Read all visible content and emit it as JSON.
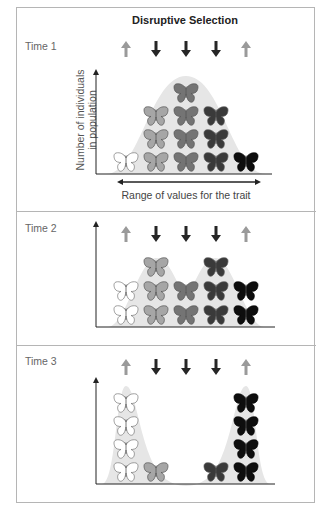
{
  "figure": {
    "title": "Disruptive Selection",
    "y_axis_label_line1": "Number of individuals",
    "y_axis_label_line2": "in population",
    "x_axis_label": "Range of values for the trait"
  },
  "selection_arrows": [
    {
      "column": 1,
      "direction": "up",
      "color": "#9a9a9a"
    },
    {
      "column": 2,
      "direction": "down",
      "color": "#262626"
    },
    {
      "column": 3,
      "direction": "down",
      "color": "#262626"
    },
    {
      "column": 4,
      "direction": "down",
      "color": "#262626"
    },
    {
      "column": 5,
      "direction": "up",
      "color": "#9a9a9a"
    }
  ],
  "phenotype_colors": [
    "#ffffff",
    "#a6a6a6",
    "#747474",
    "#3a3a3a",
    "#0e0e0e"
  ],
  "curve_fill": "#e6e6e6",
  "panels": [
    {
      "label": "Time 1",
      "counts": [
        1,
        3,
        4,
        3,
        1
      ],
      "distribution": "unimodal"
    },
    {
      "label": "Time 2",
      "counts": [
        2,
        3,
        2,
        3,
        2
      ],
      "distribution": "bimodal-emerging"
    },
    {
      "label": "Time 3",
      "counts": [
        4,
        1,
        0,
        1,
        4
      ],
      "distribution": "bimodal"
    }
  ]
}
